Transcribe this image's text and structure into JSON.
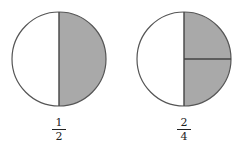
{
  "colors": {
    "shade": "#a9a9a9",
    "stroke": "#555555",
    "background": "#ffffff"
  },
  "figures": [
    {
      "name": "one-half",
      "parts": 2,
      "shaded": 1,
      "fraction": {
        "numerator": "1",
        "denominator": "2"
      }
    },
    {
      "name": "two-fourths",
      "parts": 4,
      "shaded": 2,
      "fraction": {
        "numerator": "2",
        "denominator": "4"
      }
    }
  ]
}
